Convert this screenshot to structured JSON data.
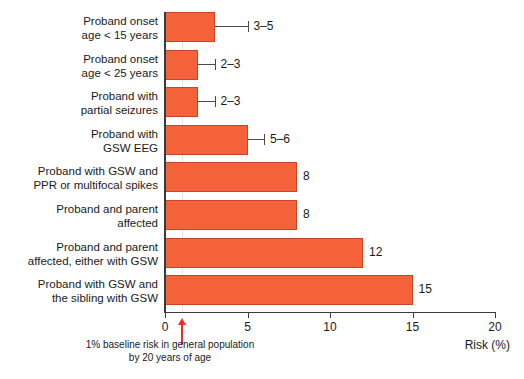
{
  "chart_data": {
    "type": "bar",
    "orientation": "horizontal",
    "title": "",
    "xlabel": "Risk (%)",
    "ylabel": "",
    "xlim": [
      0,
      20
    ],
    "xticks": [
      0,
      5,
      10,
      15,
      20
    ],
    "xtick_labels": [
      "0",
      "5",
      "10",
      "15",
      "20"
    ],
    "grid": "single vertical gridline at 1%",
    "legend": "none",
    "bar_color": "#f4623a",
    "bar_edge_color": "#c4452a",
    "categories": [
      "Proband onset age < 15 years",
      "Proband onset age < 25 years",
      "Proband with partial seizures",
      "Proband with GSW EEG",
      "Proband with GSW and PPR or multifocal spikes",
      "Proband and parent affected",
      "Proband and parent affected, either with GSW",
      "Proband with GSW and the sibling with GSW"
    ],
    "values": [
      3,
      2,
      2,
      5,
      8,
      8,
      12,
      15
    ],
    "value_labels": [
      "3–5",
      "2–3",
      "2–3",
      "5–6",
      "8",
      "8",
      "12",
      "15"
    ],
    "error_high": [
      5,
      3,
      3,
      6,
      null,
      null,
      null,
      null
    ],
    "annotations": [
      {
        "name": "baseline-marker",
        "x": 1,
        "color": "#ef2a2a",
        "text_line1": "1% baseline risk in general population",
        "text_line2": "by 20 years of age"
      }
    ]
  },
  "rows": [
    {
      "label_line1": "Proband onset",
      "label_line2": "age < 15 years",
      "value": 3,
      "value_label": "3–5",
      "error_high": 5
    },
    {
      "label_line1": "Proband onset",
      "label_line2": "age < 25 years",
      "value": 2,
      "value_label": "2–3",
      "error_high": 3
    },
    {
      "label_line1": "Proband with",
      "label_line2": "partial seizures",
      "value": 2,
      "value_label": "2–3",
      "error_high": 3
    },
    {
      "label_line1": "Proband with",
      "label_line2": "GSW EEG",
      "value": 5,
      "value_label": "5–6",
      "error_high": 6
    },
    {
      "label_line1": "Proband with GSW and",
      "label_line2": "PPR or multifocal spikes",
      "value": 8,
      "value_label": "8",
      "error_high": null
    },
    {
      "label_line1": "Proband and parent",
      "label_line2": "affected",
      "value": 8,
      "value_label": "8",
      "error_high": null
    },
    {
      "label_line1": "Proband and parent",
      "label_line2": "affected, either with GSW",
      "value": 12,
      "value_label": "12",
      "error_high": null
    },
    {
      "label_line1": "Proband with GSW and",
      "label_line2": "the sibling with GSW",
      "value": 15,
      "value_label": "15",
      "error_high": null
    }
  ],
  "axis": {
    "ticks": [
      "0",
      "5",
      "10",
      "15",
      "20"
    ],
    "title": "Risk (%)"
  },
  "baseline": {
    "note_line1": "1% baseline risk in general population",
    "note_line2": "by 20 years of age"
  }
}
